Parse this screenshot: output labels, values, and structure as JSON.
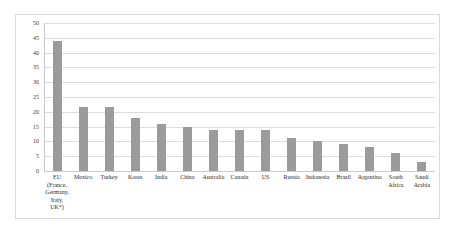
{
  "chart_data": {
    "type": "bar",
    "title": "",
    "subtitle": "",
    "xlabel": "",
    "ylabel": "",
    "ylim": [
      0,
      50
    ],
    "ytick_step": 5,
    "yticks": [
      "0",
      "5",
      "10",
      "15",
      "20",
      "25",
      "30",
      "35",
      "40",
      "45",
      "50"
    ],
    "grid": true,
    "legend": "none",
    "bar_color": "#9b9b9b",
    "gridline_color": "#dcdcdc",
    "border_color": "#d9d9d9",
    "categories": [
      "EU (France, Germany, Italy, UK*)",
      "Mexico",
      "Turkey",
      "Korea",
      "India",
      "China",
      "Australia",
      "Canada",
      "US",
      "Russia",
      "Indonesia",
      "Brazil",
      "Argentina",
      "South Africa",
      "Saudi Arabia"
    ],
    "category_lines": [
      [
        "EU",
        "(France,",
        "Germany,",
        "Italy,",
        "UK*)"
      ],
      [
        "Mexico"
      ],
      [
        "Turkey"
      ],
      [
        "Korea"
      ],
      [
        "India"
      ],
      [
        "China"
      ],
      [
        "Australia"
      ],
      [
        "Canada"
      ],
      [
        "US"
      ],
      [
        "Russia"
      ],
      [
        "Indonesia"
      ],
      [
        "Brazil"
      ],
      [
        "Argentina"
      ],
      [
        "South",
        "Africa"
      ],
      [
        "Saudi",
        "Arabia"
      ]
    ],
    "values": [
      44,
      21.5,
      21.5,
      18,
      16,
      15,
      14,
      14,
      14,
      11,
      10,
      9,
      8,
      6,
      3
    ]
  }
}
